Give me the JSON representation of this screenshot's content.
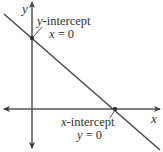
{
  "diagram": {
    "axes": {
      "x_label": "x",
      "y_label": "y"
    },
    "y_intercept": {
      "title_var": "y",
      "title_rest": "-intercept",
      "cond_var": "x",
      "cond_rest": " = 0"
    },
    "x_intercept": {
      "title_var": "x",
      "title_rest": "-intercept",
      "cond_var": "y",
      "cond_rest": " = 0"
    },
    "colors": {
      "line": "#4a4a4a",
      "axis": "#555555",
      "text": "#333333"
    }
  }
}
